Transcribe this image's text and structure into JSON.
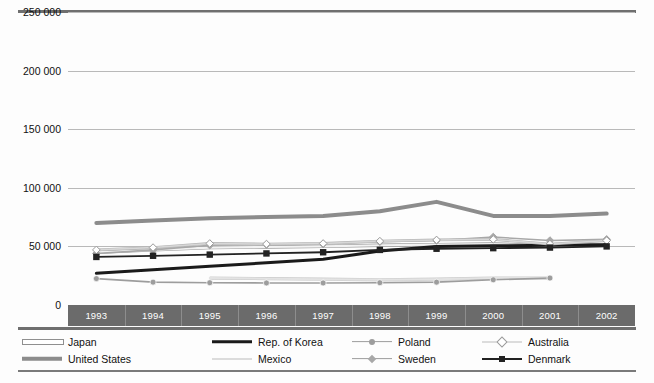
{
  "chart_data": {
    "type": "line",
    "title": "",
    "xlabel": "",
    "ylabel": "",
    "x": [
      1993,
      1994,
      1995,
      1996,
      1997,
      1998,
      1999,
      2000,
      2001,
      2002
    ],
    "xtick_labels": [
      "1993",
      "1994",
      "1995",
      "1996",
      "1997",
      "1998",
      "1999",
      "2000",
      "2001",
      "2002"
    ],
    "ylim": [
      0,
      250000
    ],
    "ytick_labels": [
      "250 000",
      "200 000",
      "150 000",
      "100 000",
      "50 000",
      "0"
    ],
    "ytick_values": [
      250000,
      200000,
      150000,
      100000,
      50000,
      0
    ],
    "grid": true,
    "legend_position": "bottom",
    "series": [
      {
        "name": "Japan",
        "color": "#f2f2f2",
        "stroke_color": "#9a9a9a",
        "width": 2.2,
        "marker": "none",
        "values": [
          45000,
          47000,
          49000,
          49500,
          50000,
          51000,
          51500,
          52000,
          50500,
          51500
        ]
      },
      {
        "name": "United States",
        "color": "#8c8c8c",
        "stroke_color": "#8c8c8c",
        "width": 4,
        "marker": "none",
        "values": [
          70000,
          72000,
          74000,
          75000,
          76000,
          80000,
          88000,
          76000,
          76000,
          78000
        ]
      },
      {
        "name": "Rep. of Korea",
        "color": "#1a1a1a",
        "stroke_color": "#1a1a1a",
        "width": 3,
        "marker": "none",
        "values": [
          27000,
          30000,
          33000,
          36000,
          39000,
          46000,
          50000,
          50500,
          51000,
          51500
        ]
      },
      {
        "name": "Mexico",
        "color": "#e3e3e3",
        "stroke_color": "#cccccc",
        "width": 2,
        "marker": "none",
        "values": [
          null,
          null,
          23000,
          22500,
          22000,
          21500,
          22000,
          23000,
          23000,
          null
        ]
      },
      {
        "name": "Poland",
        "color": "#9d9d9d",
        "stroke_color": "#9d9d9d",
        "width": 1.6,
        "marker": "circle",
        "values": [
          22500,
          19500,
          19000,
          18800,
          18800,
          19000,
          19500,
          21500,
          23000,
          null
        ]
      },
      {
        "name": "Sweden",
        "color": "#a8a8a8",
        "stroke_color": "#a8a8a8",
        "width": 1.6,
        "marker": "diamond",
        "values": [
          44000,
          47000,
          51000,
          51500,
          52000,
          54000,
          55000,
          58000,
          55000,
          56000
        ]
      },
      {
        "name": "Australia",
        "color": "#d7d7d7",
        "stroke_color": "#b5b5b5",
        "width": 1.6,
        "marker": "diamond-open",
        "values": [
          47000,
          49000,
          52500,
          52000,
          52500,
          54500,
          55500,
          56000,
          52000,
          55000
        ]
      },
      {
        "name": "Denmark",
        "color": "#222222",
        "stroke_color": "#222222",
        "width": 1.8,
        "marker": "square",
        "values": [
          41000,
          42000,
          43000,
          44000,
          45000,
          47000,
          48000,
          48500,
          49000,
          50000
        ]
      }
    ]
  },
  "legend": {
    "items": [
      {
        "label": "Japan",
        "marker": "none",
        "line": "hollow"
      },
      {
        "label": "United States",
        "marker": "none",
        "line": "thick-gray"
      },
      {
        "label": "Rep. of Korea",
        "marker": "none",
        "line": "thick-black"
      },
      {
        "label": "Mexico",
        "marker": "none",
        "line": "light"
      },
      {
        "label": "Poland",
        "marker": "circle",
        "line": "gray"
      },
      {
        "label": "Sweden",
        "marker": "diamond",
        "line": "gray"
      },
      {
        "label": "Australia",
        "marker": "diamond-open",
        "line": "light"
      },
      {
        "label": "Denmark",
        "marker": "square",
        "line": "black"
      }
    ]
  }
}
